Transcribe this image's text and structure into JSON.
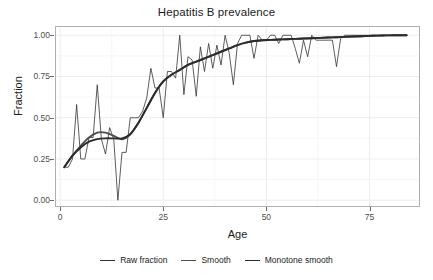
{
  "chart_data": {
    "type": "line",
    "title": "Hepatitis B prevalence",
    "xlabel": "Age",
    "ylabel": "Fraction",
    "xlim": [
      -1,
      87
    ],
    "ylim": [
      -0.035,
      1.05
    ],
    "xticks": [
      0,
      25,
      50,
      75
    ],
    "xtick_labels": [
      "0",
      "25",
      "50",
      "75"
    ],
    "yticks": [
      0.0,
      0.25,
      0.5,
      0.75,
      1.0
    ],
    "ytick_labels": [
      "0.00",
      "0.25",
      "0.50",
      "0.75",
      "1.00"
    ],
    "grid": true,
    "legend_position": "bottom",
    "series": [
      {
        "name": "Raw fraction",
        "color": "#333333",
        "width": 0.8,
        "x": [
          1,
          2,
          3,
          4,
          5,
          6,
          7,
          8,
          9,
          10,
          11,
          12,
          13,
          14,
          15,
          16,
          17,
          18,
          19,
          20,
          21,
          22,
          23,
          24,
          25,
          26,
          27,
          28,
          29,
          30,
          31,
          32,
          33,
          34,
          35,
          36,
          37,
          38,
          39,
          40,
          41,
          42,
          43,
          44,
          45,
          46,
          47,
          48,
          49,
          50,
          51,
          52,
          53,
          54,
          55,
          56,
          57,
          58,
          59,
          60,
          61,
          62,
          63,
          64,
          65,
          66,
          67,
          68,
          69,
          70,
          71,
          72,
          73,
          74,
          75,
          76,
          77,
          78,
          79,
          80,
          81,
          82,
          83,
          84
        ],
        "y": [
          0.2,
          0.2,
          0.25,
          0.58,
          0.25,
          0.25,
          0.38,
          0.38,
          0.7,
          0.37,
          0.28,
          0.44,
          0.37,
          0.0,
          0.29,
          0.29,
          0.5,
          0.5,
          0.5,
          0.54,
          0.62,
          0.8,
          0.68,
          0.68,
          0.5,
          0.78,
          0.78,
          0.74,
          1.0,
          0.64,
          0.87,
          0.85,
          0.63,
          0.93,
          0.78,
          0.95,
          0.8,
          0.94,
          0.82,
          1.0,
          0.89,
          0.7,
          0.95,
          1.0,
          1.0,
          1.0,
          0.86,
          1.0,
          0.97,
          0.97,
          1.0,
          1.0,
          0.95,
          1.0,
          1.0,
          1.0,
          0.92,
          0.83,
          0.97,
          0.87,
          1.0,
          0.97,
          0.97,
          0.97,
          0.97,
          0.97,
          0.81,
          0.98,
          1.0,
          1.0,
          1.0,
          1.0,
          1.0,
          1.0,
          1.0,
          1.0,
          1.0,
          1.0,
          1.0,
          1.0,
          1.0,
          1.0,
          1.0,
          1.0
        ]
      },
      {
        "name": "Smooth",
        "color": "#4d4d4d",
        "width": 1.9,
        "x": [
          1,
          3,
          5,
          7,
          9,
          11,
          13,
          15,
          17,
          19,
          21,
          23,
          25,
          27,
          29,
          31,
          33,
          35,
          37,
          39,
          41,
          43,
          45,
          47,
          49,
          51,
          53,
          55,
          57,
          59,
          61,
          63,
          65,
          67,
          69,
          71,
          73,
          75,
          77,
          79,
          81,
          83,
          84
        ],
        "y": [
          0.2,
          0.27,
          0.33,
          0.38,
          0.41,
          0.41,
          0.39,
          0.37,
          0.4,
          0.47,
          0.56,
          0.65,
          0.72,
          0.76,
          0.79,
          0.82,
          0.84,
          0.86,
          0.88,
          0.9,
          0.92,
          0.94,
          0.955,
          0.965,
          0.97,
          0.972,
          0.974,
          0.976,
          0.978,
          0.98,
          0.982,
          0.984,
          0.986,
          0.988,
          0.99,
          0.992,
          0.994,
          0.996,
          0.998,
          0.999,
          1.0,
          1.0,
          1.0
        ]
      },
      {
        "name": "Monotone smooth",
        "color": "#2b2b2b",
        "width": 1.9,
        "x": [
          1,
          3,
          5,
          7,
          9,
          11,
          13,
          15,
          17,
          19,
          21,
          23,
          25,
          27,
          29,
          31,
          33,
          35,
          37,
          39,
          41,
          43,
          45,
          47,
          49,
          51,
          53,
          55,
          57,
          59,
          61,
          63,
          65,
          67,
          69,
          71,
          73,
          75,
          77,
          79,
          81,
          83,
          84
        ],
        "y": [
          0.2,
          0.27,
          0.32,
          0.355,
          0.37,
          0.375,
          0.375,
          0.375,
          0.4,
          0.47,
          0.56,
          0.65,
          0.72,
          0.76,
          0.79,
          0.82,
          0.84,
          0.86,
          0.88,
          0.9,
          0.92,
          0.94,
          0.955,
          0.965,
          0.97,
          0.972,
          0.974,
          0.976,
          0.978,
          0.98,
          0.982,
          0.984,
          0.986,
          0.988,
          0.99,
          0.992,
          0.994,
          0.996,
          0.998,
          0.999,
          1.0,
          1.0,
          1.0
        ]
      }
    ]
  },
  "legend": {
    "items": [
      {
        "label": "Raw fraction",
        "color": "#333333",
        "width": 1.6
      },
      {
        "label": "Smooth",
        "color": "#4d4d4d",
        "width": 1.6
      },
      {
        "label": "Monotone smooth",
        "color": "#2b2b2b",
        "width": 1.6
      }
    ]
  },
  "colors": {
    "panel_background": "#ffffff",
    "panel_border": "#b0b0b0",
    "grid_major": "#ebebeb",
    "grid_minor": "#f4f4f4",
    "text": "#1a1a1a",
    "tick_text": "#4d4d4d"
  }
}
